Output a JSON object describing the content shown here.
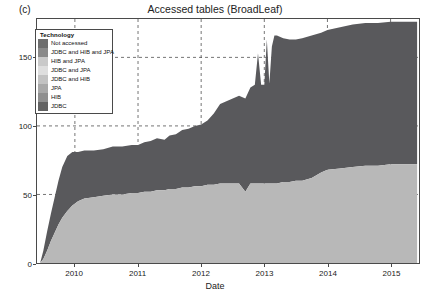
{
  "panel_label": "(c)",
  "title": "Accessed tables (BroadLeaf)",
  "legend": {
    "title": "Technology",
    "items": [
      {
        "label": "Not accessed",
        "color": "#6e6e6e"
      },
      {
        "label": "JDBC and HIB and JPA",
        "color": "#8a8a8a"
      },
      {
        "label": "HIB and JPA",
        "color": "#c9c9c9"
      },
      {
        "label": "JDBC and JPA",
        "color": "#dedede"
      },
      {
        "label": "JDBC and HIB",
        "color": "#c2c2c2"
      },
      {
        "label": "JPA",
        "color": "#a8a8a8"
      },
      {
        "label": "HIB",
        "color": "#8f8f8f"
      },
      {
        "label": "JDBC",
        "color": "#636363"
      }
    ]
  },
  "chart_data": {
    "type": "area",
    "title": "Accessed tables (BroadLeaf)",
    "xlabel": "Date",
    "ylabel": "Accesses",
    "xlim": [
      2009.4,
      2015.45
    ],
    "ylim": [
      0,
      178
    ],
    "yticks": [
      0,
      50,
      100,
      150
    ],
    "xticks": [
      2010,
      2011,
      2012,
      2013,
      2014,
      2015
    ],
    "grid": true,
    "grid_style": "dashed",
    "legend_position": "top-left-inside",
    "stacked": true,
    "colors": {
      "not_accessed": "#b8b8b8",
      "accessed": "#59595c",
      "background": "#ffffff",
      "axis": "#4a4a4a"
    },
    "x": [
      2009.45,
      2009.5,
      2009.56,
      2009.62,
      2009.68,
      2009.74,
      2009.8,
      2009.88,
      2009.96,
      2010.05,
      2010.15,
      2010.3,
      2010.45,
      2010.6,
      2010.75,
      2010.9,
      2011.0,
      2011.1,
      2011.2,
      2011.3,
      2011.42,
      2011.5,
      2011.6,
      2011.7,
      2011.8,
      2011.9,
      2012.0,
      2012.1,
      2012.2,
      2012.3,
      2012.4,
      2012.5,
      2012.6,
      2012.7,
      2012.78,
      2012.85,
      2012.9,
      2012.95,
      2013.0,
      2013.04,
      2013.08,
      2013.12,
      2013.16,
      2013.2,
      2013.3,
      2013.4,
      2013.5,
      2013.6,
      2013.75,
      2013.9,
      2014.0,
      2014.2,
      2014.4,
      2014.6,
      2014.8,
      2015.0,
      2015.2,
      2015.42
    ],
    "series": [
      {
        "name": "Not accessed",
        "color": "#b8b8b8",
        "values": [
          0,
          3,
          9,
          16,
          22,
          28,
          33,
          38,
          42,
          45,
          47,
          48,
          49,
          50,
          50,
          51,
          51,
          52,
          52,
          53,
          53,
          54,
          54,
          55,
          55,
          56,
          56,
          57,
          57,
          58,
          58,
          58,
          58,
          52,
          58,
          58,
          58,
          58,
          58,
          58,
          58,
          58,
          58,
          58,
          59,
          59,
          60,
          60,
          62,
          66,
          68,
          69,
          70,
          71,
          71,
          72,
          72,
          72
        ]
      },
      {
        "name": "Accessed (all technologies)",
        "color": "#59595c",
        "values": [
          0,
          6,
          14,
          20,
          26,
          32,
          37,
          40,
          39,
          36,
          35,
          34,
          34,
          35,
          35,
          35,
          35,
          36,
          37,
          38,
          37,
          39,
          40,
          42,
          43,
          44,
          45,
          47,
          52,
          58,
          60,
          62,
          64,
          68,
          70,
          72,
          95,
          72,
          72,
          105,
          73,
          100,
          108,
          108,
          105,
          104,
          103,
          104,
          104,
          102,
          102,
          103,
          104,
          104,
          104,
          104,
          104,
          104
        ]
      }
    ],
    "totals_note": "Stacked total rises from 0 in mid-2009 to about 176 by 2015; spikes near 2013 reach about 163-170.",
    "spikes": [
      {
        "x": 2012.9,
        "total": 153
      },
      {
        "x": 2013.04,
        "total": 163
      },
      {
        "x": 2013.16,
        "total": 166
      },
      {
        "x": 2013.2,
        "total": 166
      }
    ]
  },
  "axes": {
    "y_title": "Accesses",
    "x_title": "Date",
    "y_tick_labels": [
      "0",
      "50",
      "100",
      "150"
    ],
    "x_tick_labels": [
      "2010",
      "2011",
      "2012",
      "2013",
      "2014",
      "2015"
    ]
  }
}
